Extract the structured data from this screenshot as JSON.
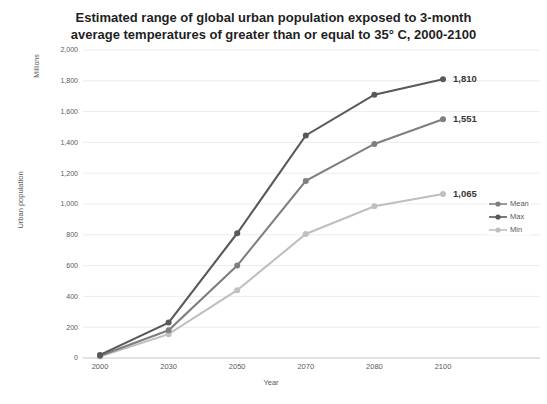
{
  "chart_data": {
    "type": "line",
    "title": "Estimated range of global urban population exposed to 3-month average temperatures of greater than or equal to 35° C, 2000-2100",
    "title_lines": [
      "Estimated range of global urban population exposed to 3-month",
      "average temperatures of greater than or equal to 35° C, 2000-2100"
    ],
    "xlabel": "Year",
    "ylabel": "Urban population",
    "y_unit": "Millions",
    "categories": [
      "2000",
      "2030",
      "2050",
      "2070",
      "2080",
      "2100"
    ],
    "series": [
      {
        "name": "Mean",
        "color": "#7f7f7f",
        "values": [
          15,
          180,
          600,
          1150,
          1390,
          1551
        ],
        "end_label": "1,551"
      },
      {
        "name": "Max",
        "color": "#595959",
        "values": [
          20,
          230,
          810,
          1445,
          1710,
          1810
        ],
        "end_label": "1,810"
      },
      {
        "name": "Min",
        "color": "#bfbfbf",
        "values": [
          10,
          155,
          440,
          805,
          985,
          1065
        ],
        "end_label": "1,065"
      }
    ],
    "ylim": [
      0,
      2000
    ],
    "yticks": [
      0,
      200,
      400,
      600,
      800,
      1000,
      1200,
      1400,
      1600,
      1800,
      2000
    ],
    "grid": true,
    "legend_position": "right",
    "colors": {
      "grid": "#ececec",
      "axis": "#c8c8c8",
      "tick_text": "#595959",
      "data_label": "#383838"
    }
  }
}
